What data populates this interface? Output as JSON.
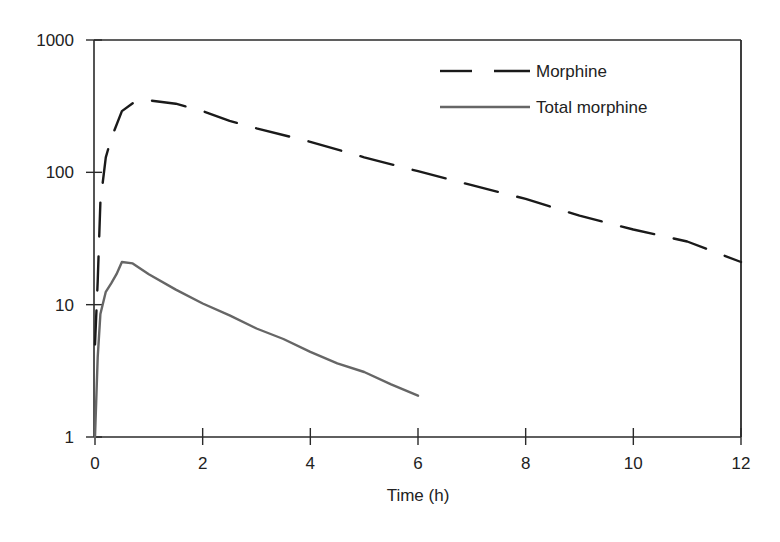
{
  "chart_data": {
    "type": "line",
    "title": "",
    "xlabel": "Time (h)",
    "ylabel": "",
    "xlim": [
      0,
      12
    ],
    "ylim": [
      1,
      1000
    ],
    "yscale": "log",
    "grid": false,
    "legend_position": "upper right (inside)",
    "x_ticks": [
      "0",
      "2",
      "4",
      "6",
      "8",
      "10",
      "12"
    ],
    "y_ticks": [
      "1",
      "10",
      "100",
      "1000"
    ],
    "series": [
      {
        "name": "Morphine",
        "style": "dashed",
        "color": "#1a1a1a",
        "x": [
          0,
          0.05,
          0.1,
          0.2,
          0.3,
          0.5,
          0.75,
          1,
          1.5,
          2,
          2.5,
          3,
          4,
          5,
          6,
          7,
          8,
          9,
          10,
          11,
          12
        ],
        "y": [
          5,
          15,
          60,
          130,
          180,
          290,
          345,
          350,
          330,
          290,
          245,
          215,
          170,
          130,
          102,
          80,
          63,
          47,
          37,
          30,
          21
        ]
      },
      {
        "name": "Total morphine",
        "style": "solid",
        "color": "#666666",
        "x": [
          0,
          0.05,
          0.1,
          0.2,
          0.3,
          0.4,
          0.5,
          0.7,
          1,
          1.5,
          2,
          2.5,
          3,
          3.5,
          4,
          4.5,
          5,
          5.5,
          6
        ],
        "y": [
          1,
          4,
          8.5,
          12.5,
          14.5,
          17,
          21,
          20.5,
          17,
          13,
          10.2,
          8.3,
          6.6,
          5.5,
          4.4,
          3.6,
          3.1,
          2.5,
          2.05
        ]
      }
    ]
  },
  "legend": {
    "items": [
      {
        "label": "Morphine",
        "style": "dashed"
      },
      {
        "label": "Total morphine",
        "style": "solid"
      }
    ]
  },
  "axes": {
    "x_title": "Time (h)",
    "x_ticks": [
      "0",
      "2",
      "4",
      "6",
      "8",
      "10",
      "12"
    ],
    "y_ticks": [
      "1000",
      "100",
      "10",
      "1"
    ]
  }
}
